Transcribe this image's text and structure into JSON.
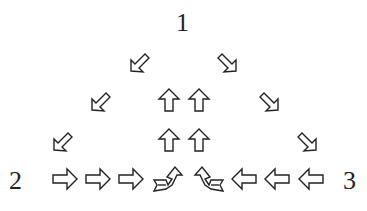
{
  "diagram": {
    "type": "arrow-flow-triangle",
    "nodes": [
      {
        "id": "n1",
        "label": "1",
        "position": "top"
      },
      {
        "id": "n2",
        "label": "2",
        "position": "bottom-left"
      },
      {
        "id": "n3",
        "label": "3",
        "position": "bottom-right"
      }
    ],
    "edges": [
      {
        "from": "1",
        "to": "2",
        "arrow": "down-left",
        "count": 3
      },
      {
        "from": "1",
        "to": "3",
        "arrow": "down-right",
        "count": 3
      },
      {
        "from": "2",
        "to": "center",
        "arrow": "right",
        "count": 3
      },
      {
        "from": "3",
        "to": "center",
        "arrow": "left",
        "count": 3
      },
      {
        "from": "center",
        "to": "1",
        "arrow": "up",
        "count": 2,
        "columns": 2
      }
    ],
    "merge_arrows": [
      {
        "direction": "right-turning-up"
      },
      {
        "direction": "left-turning-up"
      }
    ]
  }
}
